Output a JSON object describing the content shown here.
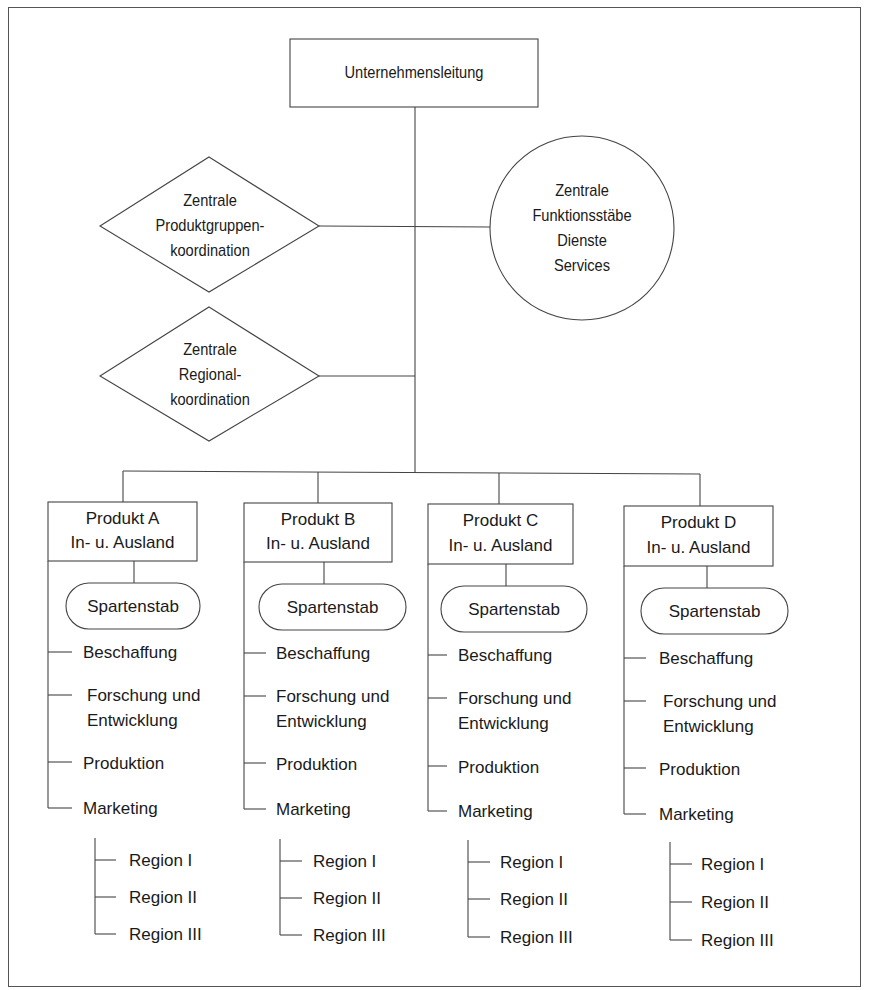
{
  "diagram": {
    "type": "org-chart",
    "top": {
      "label": "Unternehmensleitung"
    },
    "staff_units": [
      {
        "shape": "diamond",
        "lines": [
          "Zentrale",
          "Produktgruppen-",
          "koordination"
        ]
      },
      {
        "shape": "circle",
        "lines": [
          "Zentrale",
          "Funktionsstäbe",
          "Dienste",
          "Services"
        ]
      },
      {
        "shape": "diamond",
        "lines": [
          "Zentrale",
          "Regional-",
          "koordination"
        ]
      }
    ],
    "divisions": [
      {
        "title": "Produkt A",
        "subtitle": "In- u. Ausland",
        "staff": "Spartenstab",
        "functions": [
          "Beschaffung",
          "Forschung und",
          "Entwicklung",
          "Produktion",
          "Marketing"
        ],
        "regions": [
          "Region I",
          "Region II",
          "Region III"
        ]
      },
      {
        "title": "Produkt B",
        "subtitle": "In- u. Ausland",
        "staff": "Spartenstab",
        "functions": [
          "Beschaffung",
          "Forschung und",
          "Entwicklung",
          "Produktion",
          "Marketing"
        ],
        "regions": [
          "Region I",
          "Region II",
          "Region III"
        ]
      },
      {
        "title": "Produkt C",
        "subtitle": "In- u. Ausland",
        "staff": "Spartenstab",
        "functions": [
          "Beschaffung",
          "Forschung und",
          "Entwicklung",
          "Produktion",
          "Marketing"
        ],
        "regions": [
          "Region I",
          "Region II",
          "Region III"
        ]
      },
      {
        "title": "Produkt D",
        "subtitle": "In- u. Ausland",
        "staff": "Spartenstab",
        "functions": [
          "Beschaffung",
          "Forschung und",
          "Entwicklung",
          "Produktion",
          "Marketing"
        ],
        "regions": [
          "Region I",
          "Region II",
          "Region III"
        ]
      }
    ],
    "colors": {
      "line": "#444444",
      "text": "#1a1a1a",
      "background": "#ffffff"
    }
  }
}
